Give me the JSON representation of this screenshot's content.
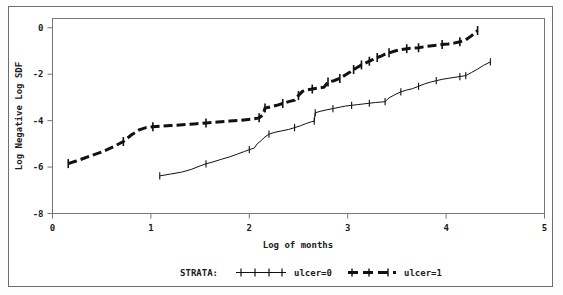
{
  "chart_data": {
    "type": "line",
    "title": "",
    "xlabel": "Log of months",
    "ylabel": "Log Negative Log SDF",
    "xlim": [
      0,
      5
    ],
    "ylim": [
      -8,
      0.4
    ],
    "xticks": [
      0,
      1,
      2,
      3,
      4,
      5
    ],
    "xtick_labels": [
      "0",
      "1",
      "2",
      "3",
      "4",
      "5"
    ],
    "yticks": [
      0,
      -2,
      -4,
      -6,
      -8
    ],
    "ytick_labels": [
      "0",
      "-2",
      "-4",
      "-6",
      "-8"
    ],
    "grid": false,
    "legend_position": "bottom",
    "legend_title": "STRATA:",
    "marker": "plus-censor-tick",
    "series": [
      {
        "name": "ulcer=0",
        "line_style": "solid",
        "line_width": 1,
        "color": "#111111",
        "points": [
          [
            1.09,
            -6.38
          ],
          [
            1.2,
            -6.3
          ],
          [
            1.31,
            -6.22
          ],
          [
            1.41,
            -6.1
          ],
          [
            1.5,
            -5.95
          ],
          [
            1.56,
            -5.86
          ],
          [
            1.63,
            -5.78
          ],
          [
            1.72,
            -5.66
          ],
          [
            1.8,
            -5.56
          ],
          [
            1.88,
            -5.44
          ],
          [
            1.95,
            -5.33
          ],
          [
            2.0,
            -5.25
          ],
          [
            2.05,
            -5.18
          ],
          [
            2.08,
            -5.0
          ],
          [
            2.12,
            -4.86
          ],
          [
            2.16,
            -4.7
          ],
          [
            2.2,
            -4.58
          ],
          [
            2.26,
            -4.5
          ],
          [
            2.33,
            -4.44
          ],
          [
            2.4,
            -4.38
          ],
          [
            2.46,
            -4.3
          ],
          [
            2.52,
            -4.22
          ],
          [
            2.58,
            -4.12
          ],
          [
            2.63,
            -4.05
          ],
          [
            2.66,
            -4.02
          ],
          [
            2.67,
            -3.66
          ],
          [
            2.72,
            -3.6
          ],
          [
            2.78,
            -3.54
          ],
          [
            2.85,
            -3.48
          ],
          [
            2.92,
            -3.42
          ],
          [
            2.98,
            -3.37
          ],
          [
            3.04,
            -3.34
          ],
          [
            3.1,
            -3.31
          ],
          [
            3.16,
            -3.28
          ],
          [
            3.22,
            -3.25
          ],
          [
            3.28,
            -3.22
          ],
          [
            3.34,
            -3.2
          ],
          [
            3.38,
            -3.18
          ],
          [
            3.42,
            -3.02
          ],
          [
            3.48,
            -2.88
          ],
          [
            3.54,
            -2.76
          ],
          [
            3.6,
            -2.68
          ],
          [
            3.66,
            -2.62
          ],
          [
            3.72,
            -2.52
          ],
          [
            3.78,
            -2.42
          ],
          [
            3.84,
            -2.34
          ],
          [
            3.9,
            -2.28
          ],
          [
            3.96,
            -2.22
          ],
          [
            4.02,
            -2.18
          ],
          [
            4.08,
            -2.14
          ],
          [
            4.14,
            -2.1
          ],
          [
            4.2,
            -2.06
          ],
          [
            4.26,
            -1.92
          ],
          [
            4.32,
            -1.78
          ],
          [
            4.38,
            -1.62
          ],
          [
            4.45,
            -1.47
          ]
        ],
        "censor_marks": [
          [
            1.09,
            -6.38
          ],
          [
            1.56,
            -5.86
          ],
          [
            2.0,
            -5.25
          ],
          [
            2.2,
            -4.58
          ],
          [
            2.46,
            -4.3
          ],
          [
            2.66,
            -4.02
          ],
          [
            2.67,
            -3.66
          ],
          [
            2.85,
            -3.48
          ],
          [
            3.04,
            -3.34
          ],
          [
            3.22,
            -3.25
          ],
          [
            3.38,
            -3.18
          ],
          [
            3.54,
            -2.76
          ],
          [
            3.72,
            -2.52
          ],
          [
            3.9,
            -2.28
          ],
          [
            4.14,
            -2.1
          ],
          [
            4.2,
            -2.06
          ],
          [
            4.45,
            -1.47
          ]
        ]
      },
      {
        "name": "ulcer=1",
        "line_style": "dashed",
        "line_width": 3,
        "color": "#111111",
        "points": [
          [
            0.16,
            -5.85
          ],
          [
            0.24,
            -5.74
          ],
          [
            0.32,
            -5.62
          ],
          [
            0.4,
            -5.5
          ],
          [
            0.48,
            -5.38
          ],
          [
            0.56,
            -5.24
          ],
          [
            0.64,
            -5.08
          ],
          [
            0.72,
            -4.9
          ],
          [
            0.8,
            -4.62
          ],
          [
            0.88,
            -4.4
          ],
          [
            0.95,
            -4.3
          ],
          [
            1.02,
            -4.26
          ],
          [
            1.1,
            -4.24
          ],
          [
            1.2,
            -4.21
          ],
          [
            1.32,
            -4.18
          ],
          [
            1.44,
            -4.14
          ],
          [
            1.56,
            -4.1
          ],
          [
            1.68,
            -4.06
          ],
          [
            1.8,
            -4.02
          ],
          [
            1.92,
            -3.98
          ],
          [
            2.02,
            -3.94
          ],
          [
            2.1,
            -3.88
          ],
          [
            2.14,
            -3.74
          ],
          [
            2.16,
            -3.46
          ],
          [
            2.22,
            -3.4
          ],
          [
            2.28,
            -3.34
          ],
          [
            2.34,
            -3.26
          ],
          [
            2.4,
            -3.18
          ],
          [
            2.46,
            -3.12
          ],
          [
            2.5,
            -2.92
          ],
          [
            2.54,
            -2.74
          ],
          [
            2.58,
            -2.68
          ],
          [
            2.64,
            -2.64
          ],
          [
            2.7,
            -2.6
          ],
          [
            2.76,
            -2.56
          ],
          [
            2.8,
            -2.34
          ],
          [
            2.86,
            -2.28
          ],
          [
            2.92,
            -2.18
          ],
          [
            2.98,
            -2.02
          ],
          [
            3.02,
            -1.92
          ],
          [
            3.06,
            -1.8
          ],
          [
            3.1,
            -1.7
          ],
          [
            3.14,
            -1.6
          ],
          [
            3.18,
            -1.52
          ],
          [
            3.22,
            -1.44
          ],
          [
            3.26,
            -1.36
          ],
          [
            3.3,
            -1.28
          ],
          [
            3.34,
            -1.22
          ],
          [
            3.38,
            -1.14
          ],
          [
            3.42,
            -1.08
          ],
          [
            3.48,
            -1.0
          ],
          [
            3.54,
            -0.94
          ],
          [
            3.6,
            -0.9
          ],
          [
            3.66,
            -0.88
          ],
          [
            3.72,
            -0.86
          ],
          [
            3.8,
            -0.8
          ],
          [
            3.88,
            -0.76
          ],
          [
            3.96,
            -0.72
          ],
          [
            4.02,
            -0.7
          ],
          [
            4.08,
            -0.66
          ],
          [
            4.14,
            -0.6
          ],
          [
            4.2,
            -0.52
          ],
          [
            4.26,
            -0.34
          ],
          [
            4.32,
            -0.12
          ]
        ],
        "censor_marks": [
          [
            0.16,
            -5.85
          ],
          [
            0.72,
            -4.9
          ],
          [
            1.02,
            -4.26
          ],
          [
            1.56,
            -4.1
          ],
          [
            2.1,
            -3.88
          ],
          [
            2.16,
            -3.46
          ],
          [
            2.34,
            -3.26
          ],
          [
            2.5,
            -2.92
          ],
          [
            2.64,
            -2.64
          ],
          [
            2.8,
            -2.34
          ],
          [
            2.92,
            -2.18
          ],
          [
            3.06,
            -1.8
          ],
          [
            3.14,
            -1.6
          ],
          [
            3.22,
            -1.44
          ],
          [
            3.3,
            -1.28
          ],
          [
            3.42,
            -1.08
          ],
          [
            3.6,
            -0.9
          ],
          [
            3.72,
            -0.86
          ],
          [
            3.96,
            -0.72
          ],
          [
            4.14,
            -0.6
          ],
          [
            4.32,
            -0.12
          ]
        ]
      }
    ]
  },
  "axes": {
    "x_title": "Log of months",
    "y_title": "Log Negative Log SDF"
  },
  "legend": {
    "title": "STRATA:",
    "entries": [
      {
        "label": "ulcer=0",
        "style": "solid-thin"
      },
      {
        "label": "ulcer=1",
        "style": "dashed-thick"
      }
    ]
  },
  "colors": {
    "line": "#111111",
    "axis": "#555555",
    "border": "#6e6e6e",
    "background": "#ffffff"
  }
}
